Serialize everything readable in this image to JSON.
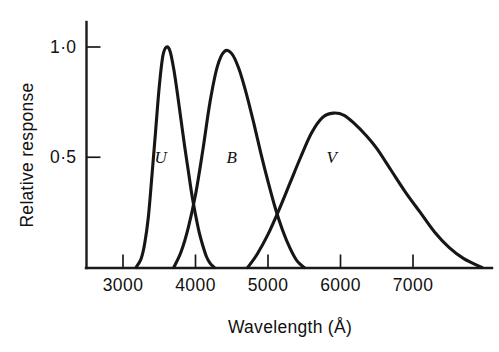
{
  "chart_data": {
    "type": "line",
    "title": "",
    "xlabel": "Wavelength (Å)",
    "ylabel": "Relative response",
    "xlim": [
      2500,
      7900
    ],
    "ylim": [
      0,
      1.1
    ],
    "grid": false,
    "legend_position": "inline-curve-labels",
    "x_ticks": [
      {
        "value": 3000,
        "label": "3000"
      },
      {
        "value": 4000,
        "label": "4000"
      },
      {
        "value": 5000,
        "label": "5000"
      },
      {
        "value": 6000,
        "label": "6000"
      },
      {
        "value": 7000,
        "label": "7000"
      }
    ],
    "y_ticks": [
      {
        "value": 0.5,
        "label": "0·5"
      },
      {
        "value": 1.0,
        "label": "1·0"
      }
    ],
    "series": [
      {
        "name": "U",
        "label": "U",
        "label_x": 3520,
        "label_y": 0.5,
        "peak_wavelength": 3580,
        "peak_response": 1.0,
        "x": [
          3180,
          3250,
          3300,
          3350,
          3400,
          3450,
          3500,
          3550,
          3600,
          3650,
          3700,
          3750,
          3800,
          3850,
          3900,
          3950,
          4000,
          4050,
          4100,
          4150,
          4200,
          4260
        ],
        "values": [
          0.0,
          0.04,
          0.11,
          0.23,
          0.42,
          0.62,
          0.82,
          0.96,
          1.0,
          0.98,
          0.9,
          0.79,
          0.67,
          0.55,
          0.44,
          0.33,
          0.24,
          0.16,
          0.1,
          0.05,
          0.02,
          0.0
        ]
      },
      {
        "name": "B",
        "label": "B",
        "label_x": 4500,
        "label_y": 0.5,
        "peak_wavelength": 4450,
        "peak_response": 0.98,
        "x": [
          3700,
          3800,
          3900,
          4000,
          4100,
          4200,
          4300,
          4400,
          4500,
          4600,
          4700,
          4800,
          4900,
          5000,
          5100,
          5200,
          5300,
          5400,
          5500
        ],
        "values": [
          0.0,
          0.07,
          0.18,
          0.33,
          0.53,
          0.75,
          0.91,
          0.98,
          0.97,
          0.9,
          0.79,
          0.66,
          0.52,
          0.39,
          0.27,
          0.17,
          0.09,
          0.03,
          0.0
        ]
      },
      {
        "name": "V",
        "label": "V",
        "label_x": 5880,
        "label_y": 0.5,
        "peak_wavelength": 5900,
        "peak_response": 0.7,
        "x": [
          4720,
          4850,
          5000,
          5150,
          5300,
          5450,
          5600,
          5750,
          5900,
          6050,
          6200,
          6350,
          6500,
          6700,
          6900,
          7100,
          7300,
          7500,
          7700,
          7950
        ],
        "values": [
          0.0,
          0.06,
          0.15,
          0.26,
          0.38,
          0.5,
          0.61,
          0.68,
          0.7,
          0.69,
          0.65,
          0.6,
          0.54,
          0.44,
          0.34,
          0.25,
          0.16,
          0.09,
          0.04,
          0.0
        ]
      }
    ],
    "annotations": [
      {
        "name": "u-b-crossover",
        "x": 4000,
        "y": 0.33
      },
      {
        "name": "b-v-crossover",
        "x": 5230,
        "y": 0.3
      }
    ]
  }
}
